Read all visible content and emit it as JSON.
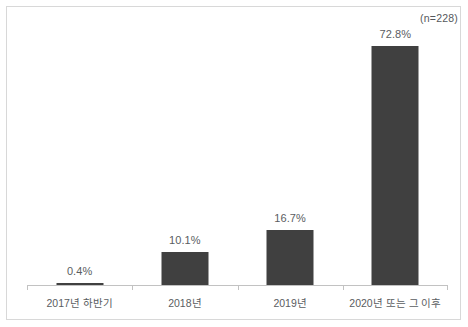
{
  "annotation": {
    "sample_size": "(n=228)"
  },
  "chart_data": {
    "type": "bar",
    "title": "",
    "subtitle": "",
    "xlabel": "",
    "ylabel": "",
    "grid": false,
    "legend": false,
    "ylim": [
      0,
      80
    ],
    "categories": [
      "2017년 하반기",
      "2018년",
      "2019년",
      "2020년 또는 그 이후"
    ],
    "values": [
      0.4,
      10.1,
      16.7,
      72.8
    ],
    "value_labels": [
      "0.4%",
      "10.1%",
      "16.7%",
      "72.8%"
    ],
    "annotations": [
      "(n=228)"
    ],
    "bar_color": "#404040",
    "label_color": "#5a5d61",
    "axis_color": "#c2c2c2",
    "background_color": "#ffffff",
    "border_color": "#d8d8d8"
  }
}
